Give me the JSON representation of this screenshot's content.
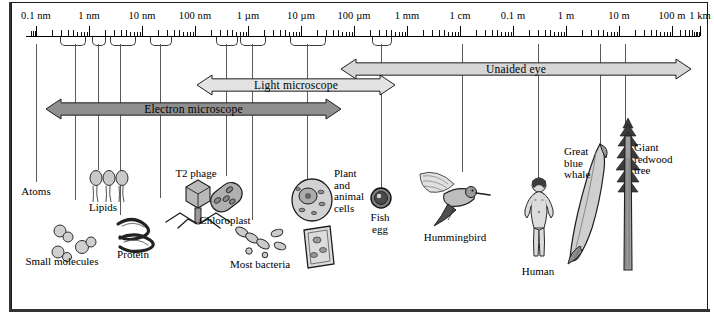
{
  "figure": {
    "background_color": "#ffffff",
    "frame_color": "#1a1a1a"
  },
  "scale": {
    "axis_type": "logarithmic",
    "unit_labels": [
      "0.1 nm",
      "1 nm",
      "10 nm",
      "100 nm",
      "1 µm",
      "10 µm",
      "100 µm",
      "1 mm",
      "1 cm",
      "0.1 m",
      "1 m",
      "10 m",
      "100 m",
      "1 km"
    ],
    "decade_x": [
      36,
      89,
      142,
      195,
      248,
      301,
      354,
      407,
      460,
      513,
      566,
      619,
      672,
      700
    ]
  },
  "ranges": [
    {
      "name": "unaided-eye",
      "label": "Unaided eye",
      "color": "#d6d6d6",
      "x": 340,
      "width": 352,
      "y": 58,
      "height": 22
    },
    {
      "name": "light-microscope",
      "label": "Light microscope",
      "color": "#e3e3e3",
      "x": 196,
      "width": 200,
      "y": 74,
      "height": 22
    },
    {
      "name": "electron-microscope",
      "label": "Electron microscope",
      "color": "#8f8f8f",
      "x": 45,
      "width": 297,
      "y": 98,
      "height": 22
    }
  ],
  "specimens": [
    {
      "name": "atoms",
      "label": "Atoms",
      "caption_x": 36,
      "caption_y": 186,
      "align": "center",
      "drop_x": 36,
      "drop_top": 44,
      "drop_bottom": 182
    },
    {
      "name": "small-molecules",
      "label": "Small molecules",
      "caption_x": 62,
      "caption_y": 256,
      "align": "center",
      "drop_x": 75,
      "drop_top": 44,
      "drop_bottom": 200
    },
    {
      "name": "lipids",
      "label": "Lipids",
      "caption_x": 103,
      "caption_y": 202,
      "align": "center",
      "drop_x": 98,
      "drop_top": 44,
      "drop_bottom": 170
    },
    {
      "name": "protein",
      "label": "Protein",
      "caption_x": 133,
      "caption_y": 249,
      "align": "center",
      "drop_x": 120,
      "drop_top": 44,
      "drop_bottom": 215
    },
    {
      "name": "t2-phage",
      "label": "T2 phage",
      "caption_x": 196,
      "caption_y": 168,
      "align": "center",
      "drop_x": 160,
      "drop_top": 44,
      "drop_bottom": 198
    },
    {
      "name": "chloroplast",
      "label": "Chloroplast",
      "caption_x": 225,
      "caption_y": 215,
      "align": "center",
      "drop_x": 226,
      "drop_top": 44,
      "drop_bottom": 176
    },
    {
      "name": "most-bacteria",
      "label": "Most bacteria",
      "caption_x": 260,
      "caption_y": 259,
      "align": "center",
      "drop_x": 252,
      "drop_top": 44,
      "drop_bottom": 220
    },
    {
      "name": "plant-animal-cells",
      "label": "Plant\nand\nanimal\ncells",
      "caption_x": 334,
      "caption_y": 168,
      "align": "left",
      "drop_x": 307,
      "drop_top": 44,
      "drop_bottom": 186
    },
    {
      "name": "fish-egg",
      "label": "Fish\negg",
      "caption_x": 380,
      "caption_y": 212,
      "align": "center",
      "drop_x": 381,
      "drop_top": 44,
      "drop_bottom": 192
    },
    {
      "name": "hummingbird",
      "label": "Hummingbird",
      "caption_x": 455,
      "caption_y": 232,
      "align": "center",
      "drop_x": 462,
      "drop_top": 44,
      "drop_bottom": 172
    },
    {
      "name": "human",
      "label": "Human",
      "caption_x": 538,
      "caption_y": 266,
      "align": "center",
      "drop_x": 538,
      "drop_top": 44,
      "drop_bottom": 182
    },
    {
      "name": "great-blue-whale",
      "label": "Great\nblue\nwhale",
      "caption_x": 564,
      "caption_y": 146,
      "align": "left",
      "drop_x": 600,
      "drop_top": 44,
      "drop_bottom": 150
    },
    {
      "name": "giant-redwood-tree",
      "label": "Giant\nredwood\ntree",
      "caption_x": 634,
      "caption_y": 142,
      "align": "left",
      "drop_x": 625,
      "drop_top": 44,
      "drop_bottom": 132
    }
  ]
}
